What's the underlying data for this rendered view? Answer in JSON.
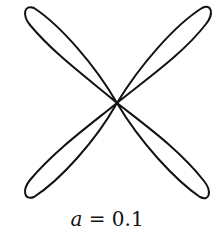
{
  "figure": {
    "type": "four-petal curve",
    "stroke_color": "#111111",
    "center": [
      117,
      103
    ],
    "petal_tips": [
      [
        25,
        8
      ],
      [
        209,
        8
      ],
      [
        25,
        197
      ],
      [
        208,
        197
      ]
    ]
  },
  "caption": {
    "variable": "a",
    "equals": " = ",
    "value": "0.1"
  }
}
